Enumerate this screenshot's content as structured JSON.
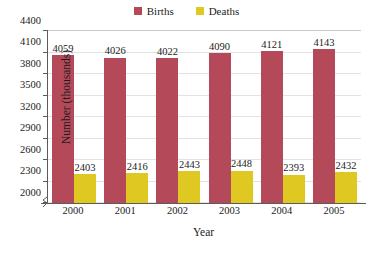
{
  "chart_data": {
    "type": "bar",
    "title": "",
    "xlabel": "Year",
    "ylabel": "Number (thousands)",
    "categories": [
      "2000",
      "2001",
      "2002",
      "2003",
      "2004",
      "2005"
    ],
    "series": [
      {
        "name": "Births",
        "color": "#b4495a",
        "values": [
          4059,
          4026,
          4022,
          4090,
          4121,
          4143
        ]
      },
      {
        "name": "Deaths",
        "color": "#e0c822",
        "values": [
          2403,
          2416,
          2443,
          2448,
          2393,
          2432
        ]
      }
    ],
    "ylim": [
      2000,
      4400
    ],
    "yticks": [
      2000,
      2300,
      2600,
      2900,
      3200,
      3500,
      3800,
      4100,
      4400
    ],
    "ytick_labels": [
      "2000",
      "2300",
      "2600",
      "2900",
      "3200",
      "3500",
      "3800",
      "4100",
      "4400"
    ],
    "grid": true,
    "axis_break": true,
    "legend_position": "top-center"
  }
}
